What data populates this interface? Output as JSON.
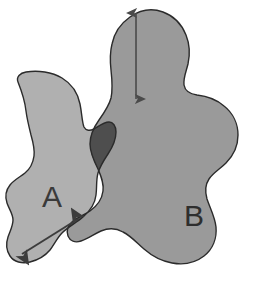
{
  "diagram": {
    "type": "overlapping-regions",
    "background_color": "#ffffff",
    "outline_color": "#2b2b2b",
    "outline_width": 1.4,
    "regions": [
      {
        "id": "region-a",
        "label": "A",
        "fill_color": "#b0b0b0",
        "label_x": 52,
        "label_y": 199
      },
      {
        "id": "region-b",
        "label": "B",
        "fill_color": "#9a9a9a",
        "label_x": 194,
        "label_y": 218
      },
      {
        "id": "region-intersection",
        "label": "",
        "fill_color": "#4e4e4e",
        "label_x": 0,
        "label_y": 0
      }
    ],
    "arrows": [
      {
        "id": "vertical-measure-arrow",
        "orientation": "vertical",
        "color": "#4a4a4a",
        "x1": 136,
        "y1": 13,
        "x2": 136,
        "y2": 99,
        "double_headed": true,
        "label": ""
      },
      {
        "id": "diagonal-measure-arrow",
        "orientation": "diagonal",
        "color": "#3c3c3c",
        "x1": 22,
        "y1": 254,
        "x2": 78,
        "y2": 219,
        "double_headed": true,
        "label": ""
      }
    ]
  }
}
